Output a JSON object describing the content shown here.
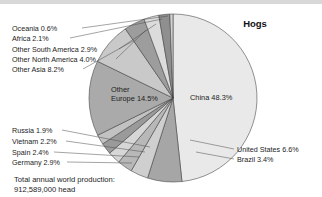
{
  "chart_data": {
    "type": "pie",
    "title": "Hogs",
    "xlabel": "",
    "ylabel": "",
    "legend_position": "callout-labels",
    "grid": false,
    "units": "head",
    "total_label": "Total annual world production:",
    "total_value": "912,589,000 head",
    "categories": [
      "China",
      "United States",
      "Brazil",
      "Germany",
      "Spain",
      "Vietnam",
      "Russia",
      "Other Europe",
      "Other Asia",
      "Other North America",
      "Other South America",
      "Africa",
      "Oceania"
    ],
    "values": [
      48.3,
      6.6,
      3.4,
      2.9,
      2.4,
      2.2,
      1.9,
      14.5,
      8.2,
      4.0,
      2.9,
      2.1,
      0.6
    ],
    "slices": [
      {
        "name": "China",
        "value": 48.3,
        "label": "China 48.3%",
        "color": "#e9e9e9",
        "placement": "inside"
      },
      {
        "name": "United States",
        "value": 6.6,
        "label": "United States 6.6%",
        "color": "#a6a6a6",
        "placement": "callout-right"
      },
      {
        "name": "Brazil",
        "value": 3.4,
        "label": "Brazil 3.4%",
        "color": "#cfcfcf",
        "placement": "callout-right"
      },
      {
        "name": "Germany",
        "value": 2.9,
        "label": "Germany 2.9%",
        "color": "#b8b8b8",
        "placement": "callout-left"
      },
      {
        "name": "Spain",
        "value": 2.4,
        "label": "Spain 2.4%",
        "color": "#d6d6d6",
        "placement": "callout-left"
      },
      {
        "name": "Vietnam",
        "value": 2.2,
        "label": "Vietnam 2.2%",
        "color": "#9a9a9a",
        "placement": "callout-left"
      },
      {
        "name": "Russia",
        "value": 1.9,
        "label": "Russia 1.9%",
        "color": "#c2c2c2",
        "placement": "callout-left"
      },
      {
        "name": "Other Europe",
        "value": 14.5,
        "label": "Other\nEurope 14.5%",
        "color": "#aaaaaa",
        "placement": "inside"
      },
      {
        "name": "Other Asia",
        "value": 8.2,
        "label": "Other Asia 8.2%",
        "color": "#c9c9c9",
        "placement": "callout-left"
      },
      {
        "name": "Other North America",
        "value": 4.0,
        "label": "Other North America 4.0%",
        "color": "#9d9d9d",
        "placement": "callout-left"
      },
      {
        "name": "Other South America",
        "value": 2.9,
        "label": "Other South America 2.9%",
        "color": "#dcdcdc",
        "placement": "callout-left"
      },
      {
        "name": "Africa",
        "value": 2.1,
        "label": "Africa 2.1%",
        "color": "#8f8f8f",
        "placement": "callout-left"
      },
      {
        "name": "Oceania",
        "value": 0.6,
        "label": "Oceania 0.6%",
        "color": "#d2d2d2",
        "placement": "callout-left"
      }
    ]
  },
  "labels": {
    "title": "Hogs",
    "china": "China 48.3%",
    "other_europe_line1": "Other",
    "other_europe_line2": "Europe 14.5%",
    "oceania": "Oceania 0.6%",
    "africa": "Africa 2.1%",
    "other_south_america": "Other South America 2.9%",
    "other_north_america": "Other North America 4.0%",
    "other_asia": "Other Asia 8.2%",
    "russia": "Russia 1.9%",
    "vietnam": "Vietnam 2.2%",
    "spain": "Spain 2.4%",
    "germany": "Germany 2.9%",
    "united_states": "United States 6.6%",
    "brazil": "Brazil 3.4%",
    "total_line1": "Total annual world production:",
    "total_line2": "912,589,000 head"
  }
}
